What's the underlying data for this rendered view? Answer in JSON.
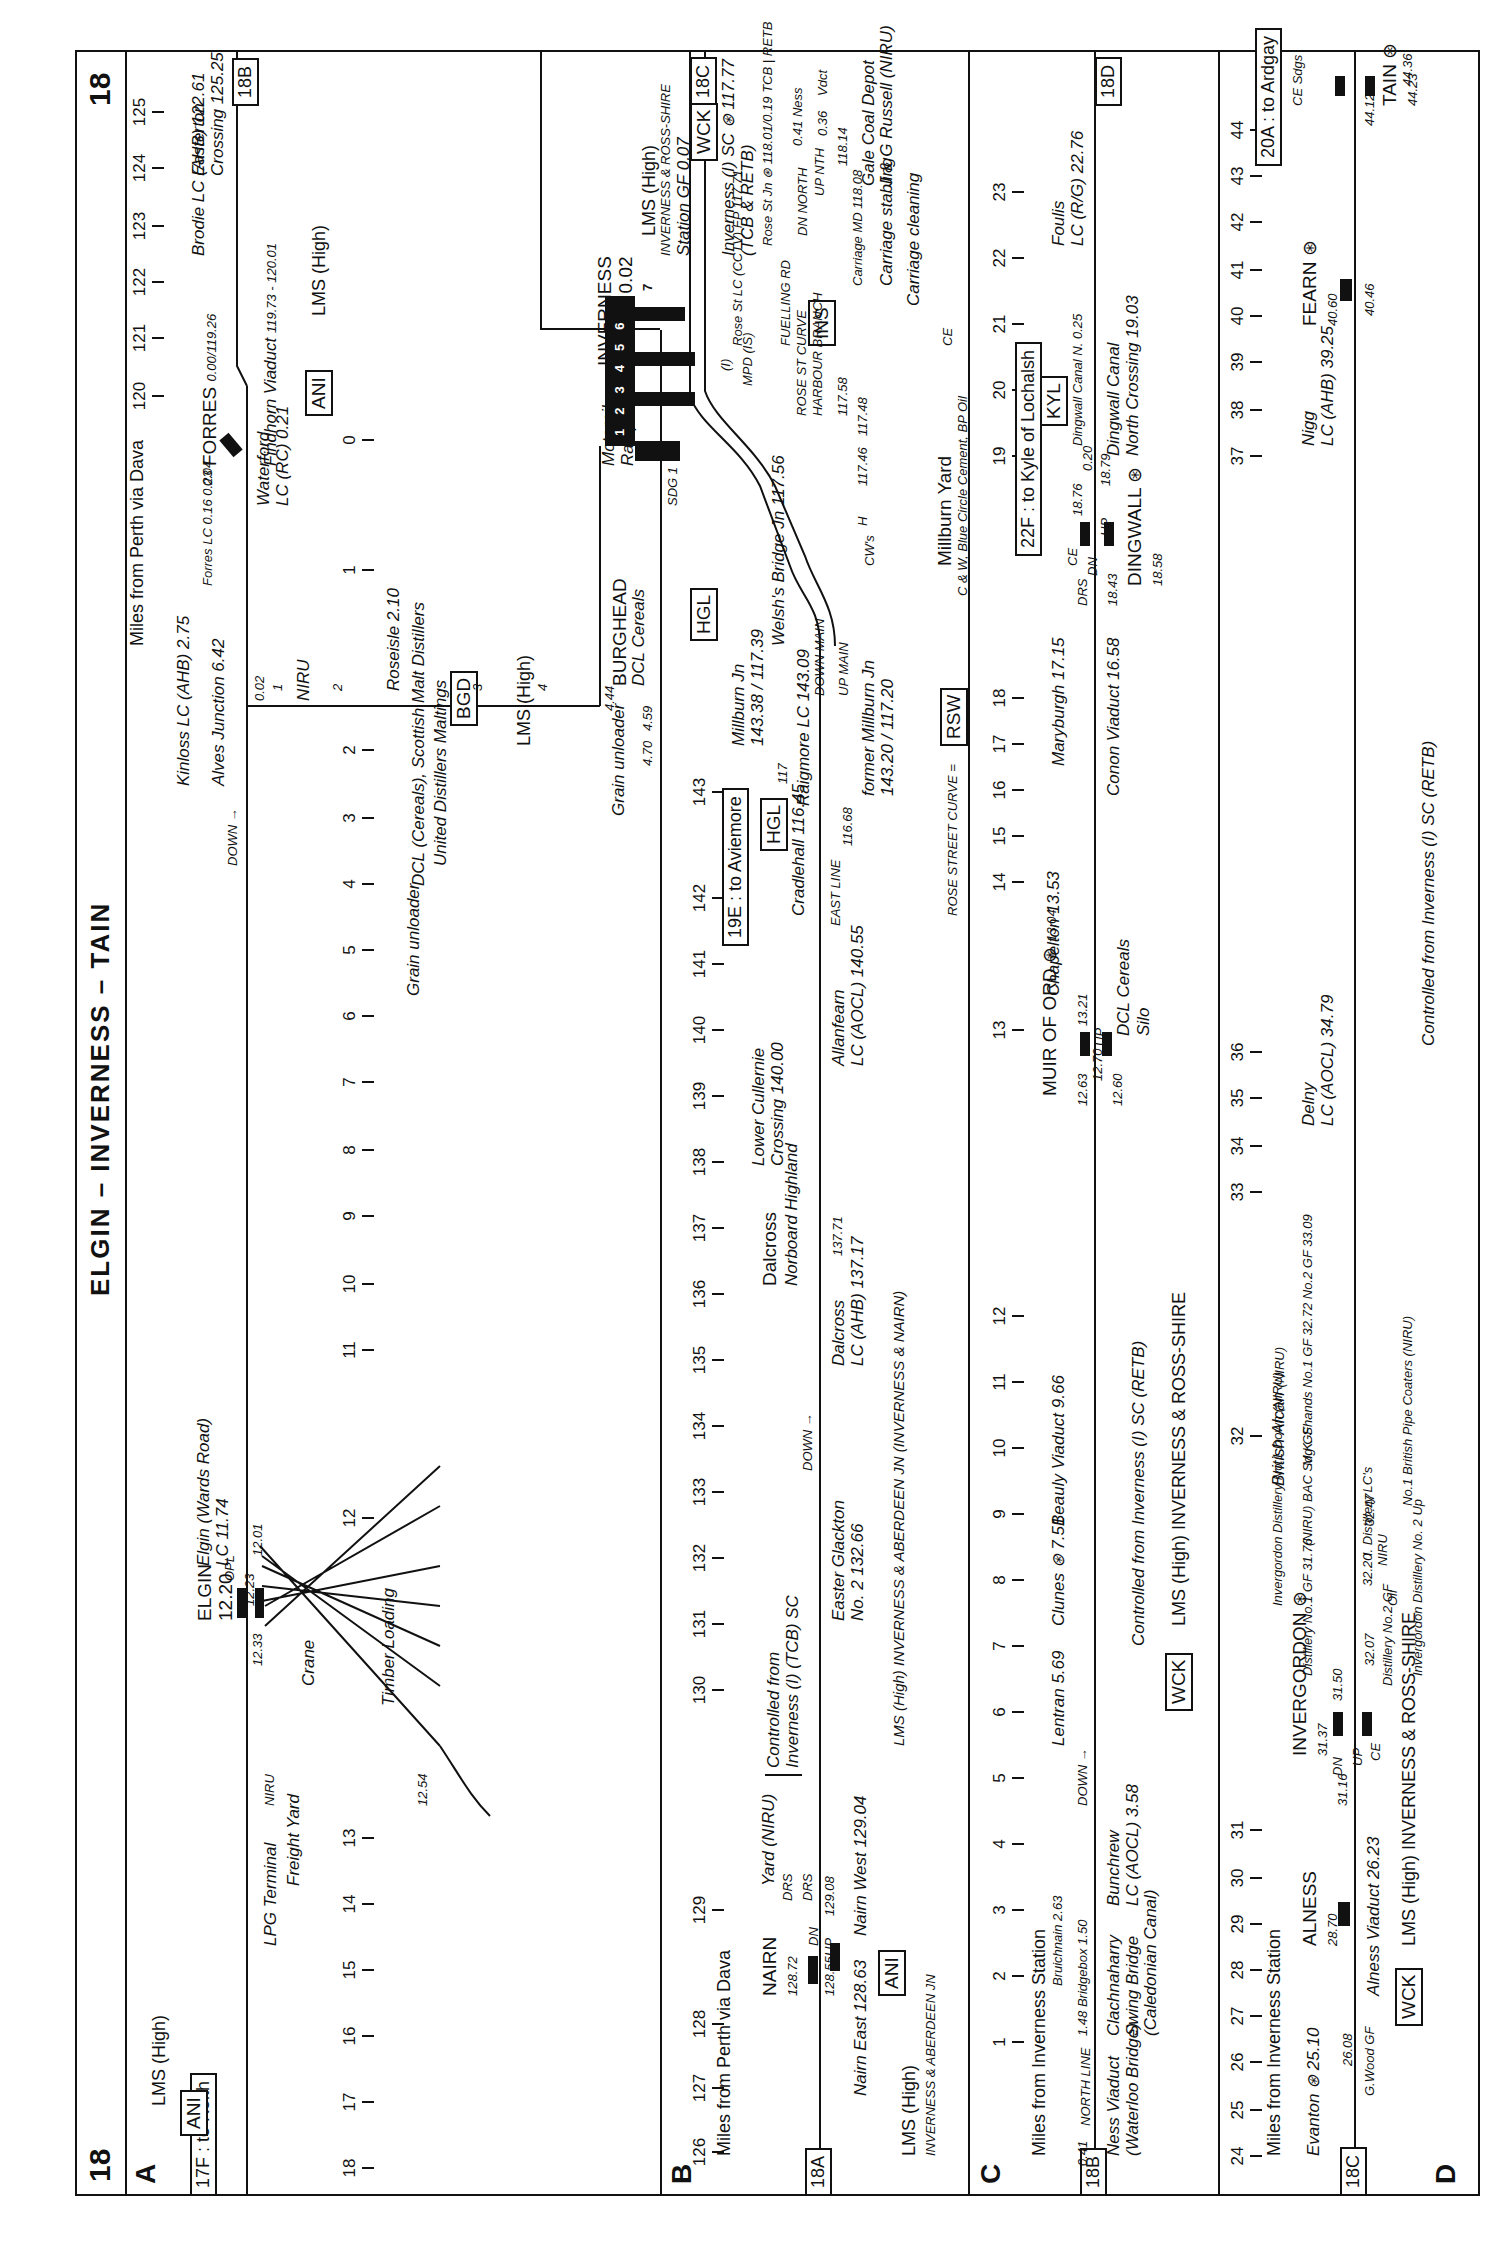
{
  "page": {
    "number": "18",
    "title": "ELGIN – INVERNESS – TAIN"
  },
  "sections": {
    "A": {
      "label": "A",
      "mileage_note_right": "Miles from Perth via Dava",
      "ref_left": "17F : to Keith",
      "ref_right": "18B",
      "codes": [
        "ANI",
        "ANI",
        "BGD"
      ],
      "company": [
        "LMS (High)",
        "LMS (High)",
        "LMS (High)",
        "NIRU"
      ],
      "direction": "DOWN →",
      "mileposts_lower": [
        "18",
        "17",
        "16",
        "15",
        "14",
        "13",
        "12",
        "11",
        "10",
        "9",
        "8",
        "7",
        "6",
        "5",
        "4",
        "3",
        "2",
        "1",
        "0"
      ],
      "mileposts_upper": [
        "120",
        "121",
        "122",
        "123",
        "124",
        "125"
      ],
      "branch_mileposts": [
        "1",
        "2",
        "3",
        "4"
      ],
      "features": {
        "lpg": "LPG Terminal",
        "niru_small": "NIRU",
        "freight_yard": "Freight Yard",
        "elgin_name": "ELGIN",
        "elgin_mileage": "12.20",
        "elgin_1233": "12.33",
        "elgin_1223": "12.23",
        "elgin_1201": "12.01",
        "elgin_1254": "12.54",
        "opl": "OPL",
        "crane": "Crane",
        "timber": "Timber Loading",
        "wards_road": "Elgin (Wards Road)",
        "wards_road_lc": "LC 11.74",
        "alves": "Alves Junction",
        "alves_mileage": "6.42",
        "alves_002": "0.02",
        "roseisle": "Roseisle 2.10",
        "dcl": "DCL (Cereals), Scottish Malt Distillers",
        "united": "United Distillers Maltings",
        "grain_unloader_1": "Grain unloader",
        "grain_unloader_2": "Grain unloader",
        "burghead": "BURGHEAD",
        "burghead_dcl": "DCL Cereals",
        "b444": "4.44",
        "b459": "4.59",
        "b470": "4.70",
        "kinloss": "Kinloss",
        "kinloss_lc": "LC (AHB)",
        "kinloss_mileage": "2.75",
        "waterford": "Waterford",
        "waterford_lc": "LC (RC) 0.21",
        "forres_lc": "Forres LC",
        "forres_016": "0.16",
        "forres_023": "0.23",
        "forres_004": "0.04",
        "dn": "DN",
        "loop": "LOOP",
        "up": "UP",
        "sdg": "SDG",
        "forres": "FORRES",
        "forres_mileage": "0.00/119.26",
        "findhorn": "Findhorn Viaduct",
        "findhorn_mileage": "119.73 - 120.01",
        "brodie": "Brodie",
        "brodie_lc": "LC (AHB)",
        "brodie_mileage": "122.61",
        "easterton": "Easterton",
        "easterton_crossing": "Crossing",
        "easterton_mileage": "125.25"
      }
    },
    "B": {
      "label": "B",
      "mileage_note": "Miles from Perth via Dava",
      "ref_left": "18A",
      "ref_right": "18C",
      "mileposts": [
        "126",
        "127",
        "128",
        "129",
        "130",
        "131",
        "132",
        "133",
        "134",
        "135",
        "136",
        "137",
        "138",
        "139",
        "140",
        "141",
        "142",
        "143"
      ],
      "codes": [
        "ANI",
        "HGL",
        "HGL",
        "WCK",
        "RSW",
        "INS"
      ],
      "features": {
        "nairn": "NAIRN",
        "nairn_mileage": "128.72",
        "nairn_12855": "128.55",
        "nairn_12908": "129.08",
        "nairn_east": "Nairn East 128.63",
        "nairn_west": "Nairn West 129.04",
        "dn": "DN",
        "up": "UP",
        "drs1": "DRS",
        "drs2": "DRS",
        "yard": "Yard (NIRU)",
        "controlled": "Controlled from",
        "controlled2": "Inverness (I) (TCB) SC",
        "easter_glackton": "Easter Glackton",
        "easter_glackton_2": "No. 2  132.66",
        "company_left": "LMS (High)",
        "company_left_2": "INVERNESS & ABERDEEN JN",
        "company_mid": "LMS (High)   INVERNESS & ABERDEEN JN  (INVERNESS & NAIRN)",
        "down": "DOWN →",
        "dalcross_lc": "Dalcross",
        "dalcross_lc_2": "LC (AHB)",
        "dalcross_lc_3": "137.17",
        "dalcross": "Dalcross",
        "norboard": "Norboard Highland",
        "n13771": "137.71",
        "lower_cullernie": "Lower Cullernie",
        "lower_cullernie_2": "Crossing",
        "lower_cullernie_3": "140.00",
        "allanfearn": "Allanfearn",
        "allanfearn_2": "LC (AOCL)",
        "allanfearn_3": "140.55",
        "to_aviemore": "19E : to Aviemore",
        "cradlehall": "Cradlehall",
        "cradlehall_mileage": "116.45",
        "east_line": "EAST LINE",
        "n11668": "116.68",
        "n117": "117",
        "raigmore": "Raigmore LC 143.09",
        "millburn_jn": "Millburn Jn",
        "millburn_jn_mileage": "143.38 / 117.39",
        "welshs_bridge": "Welsh's Bridge Jn",
        "welshs_bridge_mileage": "117.56",
        "down_main": "DOWN MAIN",
        "up_main": "UP MAIN",
        "former_millburn": "former",
        "former_millburn_2": "Millburn Jn",
        "former_millburn_3": "143.20",
        "former_millburn_4": "117.20",
        "rose_street_curve": "ROSE STREET CURVE =",
        "cws": "CW's",
        "h": "H",
        "n11746": "117.46",
        "n11748": "117.48",
        "n11758": "117.58",
        "millburn_yard": "Millburn Yard",
        "crw": "C & W, Blue Circle Cement, BP Oil",
        "ce": "CE",
        "motorail": "Motorail",
        "ramp": "Ramp",
        "ramp2": "Ramp",
        "sdg1": "SDG 1",
        "sdg": "SDG",
        "inverness": "INVERNESS",
        "inverness_mileage": "118.01 : 0.02",
        "platforms": [
          "1",
          "2",
          "3",
          "4",
          "5",
          "6",
          "7"
        ],
        "ross_shire": "ROSS-SHIRE",
        "mpd": "MPD",
        "mpd2": "(IS)",
        "i_marker": "(I)",
        "rose_st_lc": "Rose St",
        "lc_cctv": "LC (CCTV)",
        "fp": "FP 117.71",
        "fuelling_rd": "FUELLING RD",
        "rose_st_curve": "ROSE ST CURVE",
        "harbour_branch": "HARBOUR BRANCH",
        "n11774": "117.74",
        "n11770": "117.70",
        "n11773": "117.73",
        "rose_016": "0.16",
        "station_gf": "Station GF 0.07",
        "lms_high": "LMS (High)",
        "inverness_ross": "INVERNESS & ROSS-SHIRE",
        "inverness_sc": "Inverness (I) SC",
        "sc_mileage": "117.77",
        "tcb_retb": "(TCB & RETB)",
        "rose_st_jn": "Rose St Jn",
        "rose_st_jn_m": "118.01/0.19 TCB",
        "retb": "RETB",
        "dn_north": "DN NORTH",
        "up_nth": "UP NTH",
        "n041": "0.41 Ness",
        "n036": "0.36",
        "vdct": "Vdct",
        "n11814": "118.14",
        "carriage_md": "Carriage MD",
        "n11808": "118.08",
        "gale_coal": "Gale Coal Depot",
        "jg_russell": "J & G Russell",
        "niru": "(NIRU)",
        "carriage_stabling": "Carriage",
        "carriage_stabling2": "stabling",
        "carriage_cleaning": "Carriage cleaning"
      }
    },
    "C": {
      "label": "C",
      "mileage_note": "Miles from Inverness Station",
      "ref_left": "18B",
      "ref_right": "18D",
      "mileposts": [
        "1",
        "2",
        "3",
        "4",
        "5",
        "6",
        "7",
        "8",
        "9",
        "10",
        "11",
        "12",
        "13",
        "14",
        "15",
        "16",
        "17",
        "18",
        "19",
        "20",
        "21",
        "22",
        "23"
      ],
      "codes": [
        "WCK",
        "KYL"
      ],
      "features": {
        "n041": "0.41",
        "north_line": "NORTH LINE",
        "ness_viaduct": "Ness Viaduct",
        "ness_viaduct_2": "(Waterloo Bridge)",
        "n148": "1.48",
        "bridgebox": "Bridgebox",
        "n150": "1.50",
        "bruichnain": "Bruichnain",
        "n263": "2.63",
        "clachnaharry": "Clachnaharry",
        "clachnaharry_2": "Swing Bridge",
        "clachnaharry_3": "(Caledonian Canal)",
        "bunchrew": "Bunchrew",
        "bunchrew_2": "LC (AOCL)",
        "bunchrew_3": "3.58",
        "down": "DOWN →",
        "lentran": "Lentran",
        "lentran_m": "5.69",
        "clunes": "Clunes",
        "clunes_m": "7.51",
        "controlled": "Controlled from Inverness (I) SC (RETB)",
        "company": "LMS (High)  INVERNESS & ROSS-SHIRE",
        "beauly": "Beauly Viaduct",
        "beauly_m": "9.66",
        "muir_of_ord": "MUIR OF ORD",
        "muir_m": "13.04",
        "n1263": "12.63",
        "n1270": "12.70",
        "n1260": "12.60",
        "n1321": "13.21",
        "up": "UP",
        "dcl_cereals": "DCL Cereals",
        "silo": "Silo",
        "chapelton": "Chapelton",
        "chapelton_m": "13.53",
        "maryburgh": "Maryburgh",
        "maryburgh_m": "17.15",
        "conon": "Conon Viaduct",
        "conon_m": "16.58",
        "drs": "DRS",
        "ce": "CE",
        "dn": "DN",
        "n1843": "18.43",
        "n1876": "18.76",
        "n1879": "18.79",
        "dingwall": "DINGWALL",
        "dingwall_m": "18.58",
        "to_kyle": "22F : to Kyle of Lochalsh",
        "dingwall_canal_n": "Dingwall Canal N. 0.25",
        "n020": "0.20",
        "dingwall_canal": "Dingwall Canal",
        "dingwall_canal_2": "North Crossing",
        "dingwall_canal_3": "19.03",
        "foulis": "Foulis",
        "foulis_2": "LC (R/G)",
        "foulis_3": "22.76"
      }
    },
    "D": {
      "label": "D",
      "mileage_note": "Miles from Inverness Station",
      "ref_left": "18C",
      "mileposts": [
        "24",
        "25",
        "26",
        "27",
        "28",
        "29",
        "30",
        "31",
        "32",
        "33",
        "34",
        "35",
        "36",
        "37",
        "38",
        "39",
        "40",
        "41",
        "42",
        "43",
        "44"
      ],
      "codes": [
        "WCK"
      ],
      "features": {
        "evanton": "Evanton",
        "evanton_m": "25.10",
        "gwood": "G.Wood",
        "gf": "GF",
        "n2608": "26.08",
        "alness_viaduct": "Alness Viaduct",
        "alness_viaduct_m": "26.23",
        "alness": "ALNESS",
        "alness_m": "28.70",
        "company": "LMS (High)  INVERNESS & ROSS-SHIRE",
        "n3116": "31.16",
        "dn": "DN",
        "up": "UP",
        "ce": "CE",
        "invergordon": "INVERGORDON",
        "invergordon_m": "31.37",
        "n3150": "31.50",
        "distillery_1gf": "Distillery",
        "distillery_1gf_2": "No.1 GF",
        "distillery_1gf_3": "31.76",
        "invergordon_distillery": "Invergordon",
        "invergordon_distillery_2": "Distillery",
        "invergordon_distillery_3": "No.1 Down",
        "niru1": "(NIRU)",
        "n3207": "32.07",
        "distillery_2gf": "Distillery",
        "distillery_2gf_2": "No.2 GF",
        "oil": "Oil",
        "niru2": "NIRU",
        "invergordon_up": "Invergordon Distillery",
        "invergordon_up_2": "No. 2 Up",
        "n3220": "32.20",
        "i_distillery": "I. Distillery",
        "lcs": "LC's",
        "niru3": "(NIRU)",
        "bac": "BAC",
        "sdggf": "Sdg GF",
        "n3247": "32.47",
        "british_alcan": "British Alcan",
        "niru4": "(NIRU)",
        "mk_shands": "M.K. Shands",
        "no1gf": "No.1 GF",
        "no1gf_m": "32.72",
        "no2gf": "No.2 GF",
        "no2gf_m": "33.09",
        "no1": "No.1",
        "british_pipe": "British Pipe",
        "coaters": "Coaters (NIRU)",
        "delny": "Delny",
        "delny_2": "LC (AOCL)",
        "delny_3": "34.79",
        "controlled": "Controlled from Inverness (I) SC (RETB)",
        "nigg": "Nigg",
        "nigg_2": "LC (AHB)",
        "nigg_3": "39.25",
        "n4046": "40.46",
        "fearn": "FEARN",
        "fearn_m": "40.60",
        "n4412": "44.12",
        "tain": "TAIN",
        "tain_m": "44.23",
        "n4436": "44.36",
        "ce_sdgs": "CE Sdgs",
        "to_ardgay": "20A : to Ardgay"
      }
    }
  }
}
